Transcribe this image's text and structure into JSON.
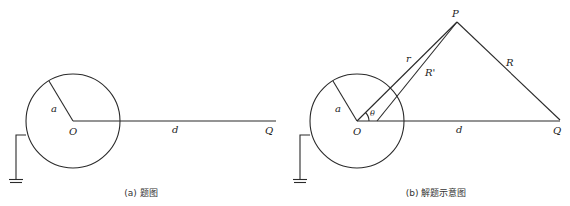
{
  "panels": [
    {
      "id": "a",
      "caption": "(a) 题图",
      "labels": {
        "radius": "a",
        "center": "O",
        "distance": "d",
        "charge": "Q"
      }
    },
    {
      "id": "b",
      "caption": "(b) 解题示意图",
      "labels": {
        "radius": "a",
        "center": "O",
        "distance": "d",
        "charge": "Q",
        "point": "P",
        "r": "r",
        "r_prime": "R'",
        "big_r": "R",
        "angle": "θ"
      }
    }
  ],
  "colors": {
    "line": "#2a2a2a",
    "text": "#222222",
    "background": "#ffffff"
  }
}
